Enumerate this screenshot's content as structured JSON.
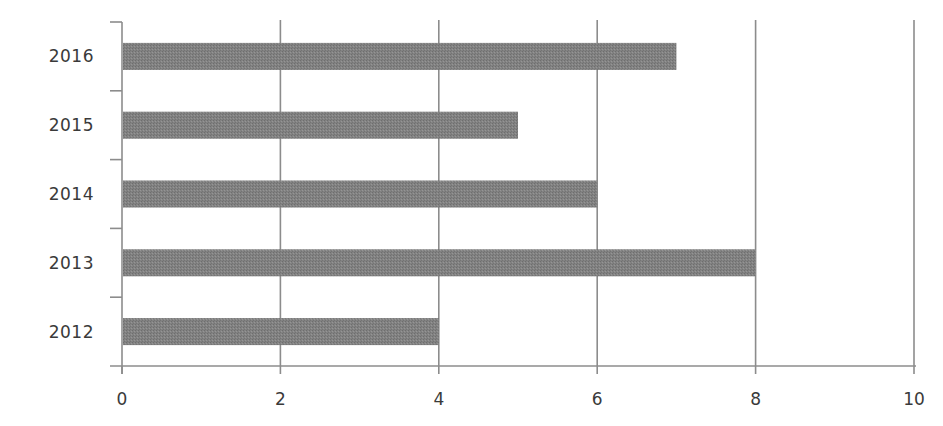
{
  "chart_data": {
    "type": "bar",
    "orientation": "horizontal",
    "title": "",
    "xlabel": "",
    "ylabel": "",
    "categories": [
      "2012",
      "2013",
      "2014",
      "2015",
      "2016"
    ],
    "values": [
      4,
      8,
      6,
      5,
      7
    ],
    "xlim": [
      0,
      10
    ],
    "xticks": [
      "0",
      "2",
      "4",
      "6",
      "8",
      "10"
    ],
    "grid": {
      "vertical": true,
      "horizontal": false
    },
    "legend": null,
    "bar_color": "#808080",
    "gridline_color": "#8c8c8c",
    "label_color": "#3a3a3a"
  }
}
